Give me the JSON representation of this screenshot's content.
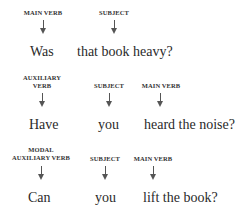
{
  "rows": [
    {
      "columns": [
        {
          "label": "MAIN VERB",
          "word": "Was"
        },
        {
          "label": "SUBJECT",
          "word": "that book heavy?"
        }
      ]
    },
    {
      "columns": [
        {
          "label_line1": "AUXILIARY",
          "label_line2": "VERB",
          "word": "Have"
        },
        {
          "label": "SUBJECT",
          "word": "you"
        },
        {
          "label": "MAIN VERB",
          "word": "heard the noise?"
        }
      ]
    },
    {
      "columns": [
        {
          "label_line1": "MODAL",
          "label_line2": "AUXILIARY VERB",
          "word": "Can"
        },
        {
          "label": "SUBJECT",
          "word": "you"
        },
        {
          "label": "MAIN VERB",
          "word": "lift the book?"
        }
      ]
    }
  ]
}
